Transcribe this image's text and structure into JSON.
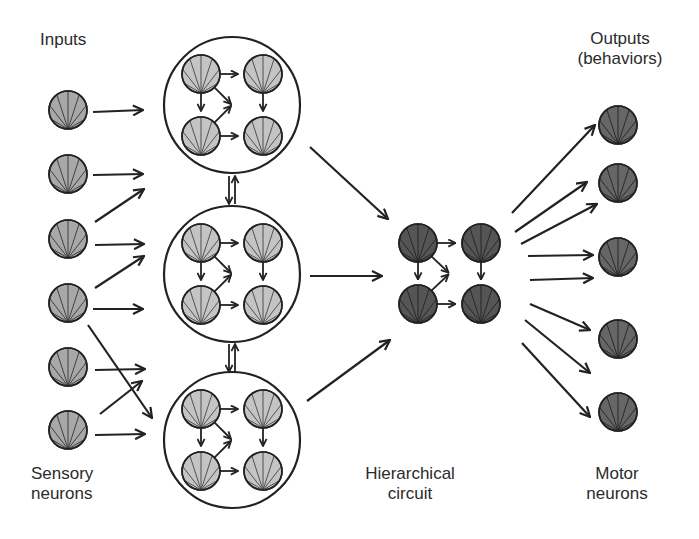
{
  "labels": {
    "inputs": "Inputs",
    "outputs_line1": "Outputs",
    "outputs_line2": "(behaviors)",
    "sensory_line1": "Sensory",
    "sensory_line2": "neurons",
    "hierarchical_line1": "Hierarchical",
    "hierarchical_line2": "circuit",
    "motor_line1": "Motor",
    "motor_line2": "neurons"
  },
  "colors": {
    "stroke": "#222222",
    "sensory_fill": "#a8a8a8",
    "module_neuron_fill": "#c4c4c4",
    "circuit_fill": "#555555",
    "motor_fill": "#666666",
    "fan_line": "#8a8a8a",
    "background": "#ffffff"
  },
  "neuron_radius": 19,
  "sensory_neurons": [
    {
      "cx": 68,
      "cy": 110
    },
    {
      "cx": 68,
      "cy": 174
    },
    {
      "cx": 68,
      "cy": 239
    },
    {
      "cx": 68,
      "cy": 303
    },
    {
      "cx": 68,
      "cy": 367
    },
    {
      "cx": 68,
      "cy": 430
    }
  ],
  "modules": [
    {
      "cx": 232,
      "cy": 105,
      "r": 68
    },
    {
      "cx": 232,
      "cy": 274,
      "r": 68
    },
    {
      "cx": 232,
      "cy": 440,
      "r": 68
    }
  ],
  "module_inner_offsets": {
    "dx": 31,
    "dy": 31
  },
  "circuit": {
    "cx": 449.5,
    "cy": 273.5,
    "dx": 31.5,
    "dy": 30.5
  },
  "motor_neurons": [
    {
      "cx": 618,
      "cy": 125
    },
    {
      "cx": 618,
      "cy": 183
    },
    {
      "cx": 618,
      "cy": 257
    },
    {
      "cx": 618,
      "cy": 339
    },
    {
      "cx": 618,
      "cy": 412
    }
  ],
  "input_arrows": [
    [
      93,
      112,
      143,
      110
    ],
    [
      93,
      175,
      143,
      174
    ],
    [
      95,
      222,
      144,
      189
    ],
    [
      95,
      245,
      144,
      244
    ],
    [
      95,
      288,
      144,
      256
    ],
    [
      93,
      309,
      143,
      309
    ],
    [
      88,
      325,
      152,
      418
    ],
    [
      95,
      370,
      145,
      369
    ],
    [
      100,
      414,
      142,
      381
    ],
    [
      95,
      435,
      145,
      434
    ]
  ],
  "module_links": [
    [
      229,
      176,
      229,
      204
    ],
    [
      235,
      204,
      235,
      176
    ],
    [
      229,
      344,
      229,
      372
    ],
    [
      235,
      372,
      235,
      344
    ]
  ],
  "module_to_circuit_arrows": [
    [
      310,
      147,
      388,
      219
    ],
    [
      310,
      276,
      382,
      276
    ],
    [
      307,
      401,
      390,
      340
    ]
  ],
  "output_arrows": [
    [
      512,
      213,
      595,
      125
    ],
    [
      515,
      232,
      587,
      182
    ],
    [
      521,
      244,
      597,
      204
    ],
    [
      528,
      256,
      593,
      255
    ],
    [
      530,
      280,
      593,
      278
    ],
    [
      530,
      304,
      590,
      330
    ],
    [
      525,
      320,
      590,
      373
    ],
    [
      522,
      343,
      590,
      417
    ]
  ]
}
